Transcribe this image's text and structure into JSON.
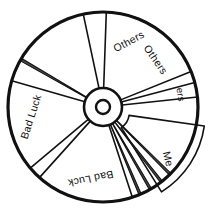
{
  "figure": {
    "background_color": "#ffffff",
    "outline_color": "#111111",
    "sliver_fill_color": "#4a4a4a",
    "center": {
      "x": 103,
      "y": 107
    },
    "outer_radius": 95,
    "hub_outer_radius": 19,
    "hub_inner_radius": 7
  },
  "chart_data": {
    "type": "pie",
    "xlabel": "",
    "ylabel": "",
    "legend_position": "none",
    "grid": false,
    "categories": [
      "Others",
      "Others",
      "Others",
      "Me",
      "Bad Luck",
      "Bad Luck"
    ],
    "values": [
      21,
      21,
      2,
      17,
      22,
      17
    ],
    "annotations": [
      "Me slice is exploded outward away from the wheel centre",
      "Thin sliver wedges separate the main sectors"
    ]
  },
  "sectors": [
    {
      "id": "others-top-left",
      "label": "Others",
      "start_angle": 258,
      "end_angle": 322,
      "label_angle": 292,
      "label_radius": 70,
      "label_rotation": -28,
      "exploded": false,
      "label_size": "normal"
    },
    {
      "id": "others-top-right",
      "label": "Others",
      "start_angle": 272,
      "end_angle": 338,
      "label_angle": 318,
      "label_radius": 70,
      "label_rotation": 55,
      "exploded": false,
      "label_size": "normal"
    },
    {
      "id": "others-right-sliver",
      "label": "ers",
      "start_angle": 345,
      "end_angle": 354,
      "label_angle": 351,
      "label_radius": 78,
      "label_rotation": 82,
      "exploded": false,
      "label_size": "small"
    },
    {
      "id": "me-right",
      "label": "Me",
      "start_angle": 8,
      "end_angle": 58,
      "label_angle": 40,
      "label_radius": 72,
      "label_rotation": 76,
      "exploded": true,
      "label_size": "normal"
    },
    {
      "id": "bad-luck-bottom",
      "label": "Bad Luck",
      "start_angle": 72,
      "end_angle": 132,
      "label_angle": 100,
      "label_radius": 72,
      "label_rotation": 168,
      "exploded": false,
      "label_size": "normal"
    },
    {
      "id": "bad-luck-left",
      "label": "Bad Luck",
      "start_angle": 140,
      "end_angle": 196,
      "label_angle": 172,
      "label_radius": 72,
      "label_rotation": -72,
      "exploded": false,
      "label_size": "normal"
    }
  ],
  "slivers": [
    {
      "id": "sliver-upper-left",
      "angle": 210,
      "width": 1.6
    },
    {
      "id": "sliver-lower-right-a",
      "angle": 45,
      "width": 1.4
    },
    {
      "id": "sliver-lower-right-b",
      "angle": 52,
      "width": 1.4
    },
    {
      "id": "sliver-lower-right-c",
      "angle": 60,
      "width": 1.4
    },
    {
      "id": "sliver-lower-right-d",
      "angle": 67,
      "width": 1.4
    }
  ]
}
